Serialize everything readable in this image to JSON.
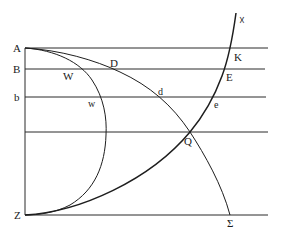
{
  "figure": {
    "type": "geometric construction",
    "line_color": "#1e1e1e",
    "background": "#ffffff",
    "points": {
      "A": "A",
      "B": "B",
      "b": "b",
      "Z": "Z",
      "W": "W",
      "w": "w",
      "D": "D",
      "d": "d",
      "Q": "Q",
      "Sigma": "Σ",
      "K": "K",
      "E": "E",
      "e": "e",
      "X": "☓"
    },
    "horizontal_lines": [
      "through A",
      "through B",
      "through b",
      "through Q",
      "through Z"
    ],
    "vertical_lines": [
      "A to Z"
    ],
    "curves": [
      {
        "name": "AWwZ",
        "through": [
          "A",
          "W",
          "w",
          "Z"
        ]
      },
      {
        "name": "ADdQΣ",
        "through": [
          "A",
          "D",
          "d",
          "Q",
          "Σ"
        ]
      },
      {
        "name": "ZQeEK",
        "through": [
          "Z",
          "Q",
          "e",
          "E",
          "K",
          "☓"
        ]
      }
    ]
  }
}
